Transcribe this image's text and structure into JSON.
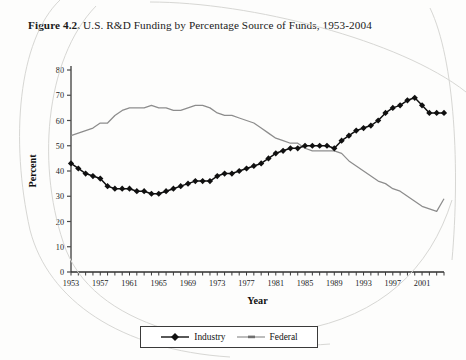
{
  "figure": {
    "number": "Figure 4.2.",
    "caption": "U.S. R&D Funding by Percentage Source of Funds, 1953-2004"
  },
  "legend": {
    "items": [
      {
        "label": "Industry",
        "color": "#101010",
        "marker": "diamond"
      },
      {
        "label": "Federal",
        "color": "#8d8d8d",
        "marker": "line"
      }
    ]
  },
  "axes": {
    "x_title": "Year",
    "y_title": "Percent",
    "x_tick_labels": [
      "1953",
      "1957",
      "1961",
      "1965",
      "1969",
      "1973",
      "1977",
      "1981",
      "1985",
      "1989",
      "1993",
      "1997",
      "2001"
    ],
    "y_tick_labels": [
      "0",
      "10",
      "20",
      "30",
      "40",
      "50",
      "60",
      "70",
      "80"
    ]
  },
  "chart_data": {
    "type": "line",
    "title": "U.S. R&D Funding by Percentage Source of Funds, 1953-2004",
    "xlabel": "Year",
    "ylabel": "Percent",
    "xlim": [
      1953,
      2004
    ],
    "ylim": [
      0,
      80
    ],
    "ytick_step": 10,
    "xtick_step": 1,
    "xtick_label_step": 4,
    "grid": false,
    "legend_position": "bottom",
    "x": [
      1953,
      1954,
      1955,
      1956,
      1957,
      1958,
      1959,
      1960,
      1961,
      1962,
      1963,
      1964,
      1965,
      1966,
      1967,
      1968,
      1969,
      1970,
      1971,
      1972,
      1973,
      1974,
      1975,
      1976,
      1977,
      1978,
      1979,
      1980,
      1981,
      1982,
      1983,
      1984,
      1985,
      1986,
      1987,
      1988,
      1989,
      1990,
      1991,
      1992,
      1993,
      1994,
      1995,
      1996,
      1997,
      1998,
      1999,
      2000,
      2001,
      2002,
      2003,
      2004
    ],
    "series": [
      {
        "name": "Industry",
        "color": "#101010",
        "values": [
          43,
          41,
          39,
          38,
          37,
          34,
          33,
          33,
          33,
          32,
          32,
          31,
          31,
          32,
          33,
          34,
          35,
          36,
          36,
          36,
          38,
          39,
          39,
          40,
          41,
          42,
          43,
          45,
          47,
          48,
          49,
          49,
          50,
          50,
          50,
          50,
          49,
          52,
          54,
          56,
          57,
          58,
          60,
          63,
          65,
          66,
          68,
          69,
          66,
          63,
          63,
          63
        ]
      },
      {
        "name": "Federal",
        "color": "#8d8d8d",
        "values": [
          54,
          55,
          56,
          57,
          59,
          59,
          62,
          64,
          65,
          65,
          65,
          66,
          65,
          65,
          64,
          64,
          65,
          66,
          66,
          65,
          63,
          62,
          62,
          61,
          60,
          59,
          57,
          55,
          53,
          52,
          51,
          51,
          49,
          48,
          48,
          48,
          48,
          47,
          44,
          42,
          40,
          38,
          36,
          35,
          33,
          32,
          30,
          28,
          26,
          25,
          24,
          29
        ]
      }
    ]
  }
}
